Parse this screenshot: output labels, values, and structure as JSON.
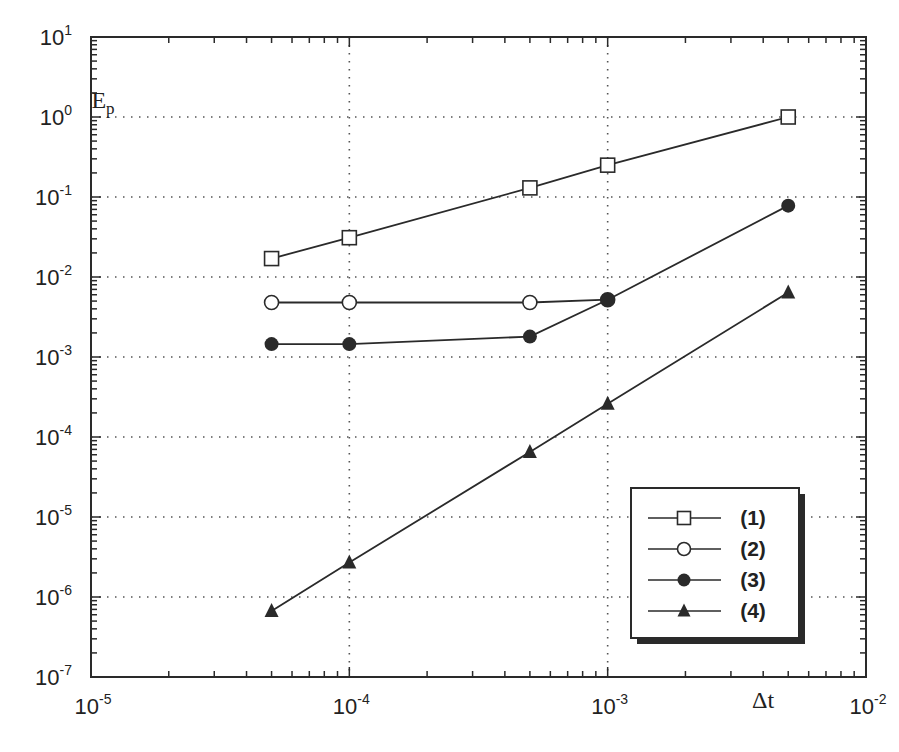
{
  "chart_data": {
    "type": "line",
    "title": "",
    "xlabel": "Δt",
    "ylabel": "E_p",
    "xscale": "log",
    "yscale": "log",
    "xlim": [
      1e-05,
      0.01
    ],
    "ylim": [
      1e-07,
      10
    ],
    "grid": true,
    "grid_style": "dotted",
    "legend_position": "lower right",
    "x_ticks": [
      {
        "value": 1e-05,
        "base": "10",
        "exp": "-5"
      },
      {
        "value": 0.0001,
        "base": "10",
        "exp": "-4"
      },
      {
        "value": 0.001,
        "base": "10",
        "exp": "-3"
      },
      {
        "value": 0.01,
        "base": "10",
        "exp": "-2"
      }
    ],
    "y_ticks": [
      {
        "value": 10,
        "base": "10",
        "exp": "1"
      },
      {
        "value": 1,
        "base": "10",
        "exp": "0"
      },
      {
        "value": 0.1,
        "base": "10",
        "exp": "-1"
      },
      {
        "value": 0.01,
        "base": "10",
        "exp": "-2"
      },
      {
        "value": 0.001,
        "base": "10",
        "exp": "-3"
      },
      {
        "value": 0.0001,
        "base": "10",
        "exp": "-4"
      },
      {
        "value": 1e-05,
        "base": "10",
        "exp": "-5"
      },
      {
        "value": 1e-06,
        "base": "10",
        "exp": "-6"
      },
      {
        "value": 1e-07,
        "base": "10",
        "exp": "-7"
      }
    ],
    "series": [
      {
        "name": "(1)",
        "marker": "open-square",
        "x": [
          5e-05,
          0.0001,
          0.0005,
          0.001,
          0.005
        ],
        "values": [
          0.017,
          0.031,
          0.13,
          0.25,
          1.0
        ]
      },
      {
        "name": "(2)",
        "marker": "open-circle",
        "x": [
          5e-05,
          0.0001,
          0.0005,
          0.001
        ],
        "values": [
          0.0048,
          0.0048,
          0.0048,
          0.0052
        ]
      },
      {
        "name": "(3)",
        "marker": "filled-circle",
        "x": [
          5e-05,
          0.0001,
          0.0005,
          0.001,
          0.005
        ],
        "values": [
          0.00145,
          0.00145,
          0.0018,
          0.0052,
          0.078
        ]
      },
      {
        "name": "(4)",
        "marker": "filled-triangle",
        "x": [
          5e-05,
          0.0001,
          0.0005,
          0.001,
          0.005
        ],
        "values": [
          6.7e-07,
          2.7e-06,
          6.5e-05,
          0.00026,
          0.0064
        ]
      }
    ]
  },
  "colors": {
    "line": "#2a2a2a",
    "grid": "#555555",
    "background": "#ffffff"
  }
}
